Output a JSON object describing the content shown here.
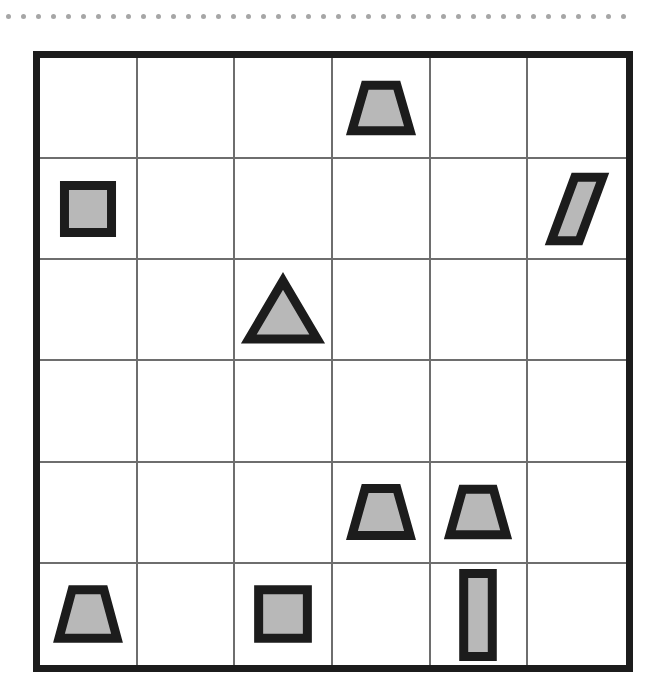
{
  "canvas": {
    "width": 662,
    "height": 691,
    "background": "#ffffff"
  },
  "decoration": {
    "dot_rule": {
      "name": "dotted-separator",
      "dot_count": 42,
      "dot_color": "#a6a6a6",
      "dot_diameter_px": 5,
      "spacing_px": 15
    }
  },
  "grid": {
    "rows": 6,
    "columns": 6,
    "border_color": "#1c1c1c",
    "border_width_px": 7,
    "line_color": "#6e6e6e",
    "line_width_px": 2,
    "cell_background": "#ffffff",
    "bounds_px": {
      "x": 33,
      "y": 51,
      "width": 600,
      "height": 621
    }
  },
  "style": {
    "shape_fill": "#b8b8b8",
    "shape_stroke": "#1c1c1c",
    "shape_stroke_width_px": 6
  },
  "shapes": [
    {
      "id": "shape-1",
      "type": "trapezoid",
      "row": 1,
      "col": 4,
      "label": "trapezoid",
      "width_px": 66,
      "height_px": 54
    },
    {
      "id": "shape-2",
      "type": "square",
      "row": 2,
      "col": 1,
      "label": "square",
      "width_px": 56,
      "height_px": 56
    },
    {
      "id": "shape-3",
      "type": "parallelogram",
      "row": 2,
      "col": 6,
      "label": "parallelogram",
      "width_px": 56,
      "height_px": 72
    },
    {
      "id": "shape-4",
      "type": "triangle",
      "row": 3,
      "col": 3,
      "label": "triangle",
      "width_px": 76,
      "height_px": 66
    },
    {
      "id": "shape-5",
      "type": "trapezoid",
      "row": 5,
      "col": 4,
      "label": "trapezoid",
      "width_px": 66,
      "height_px": 56
    },
    {
      "id": "shape-6",
      "type": "trapezoid",
      "row": 5,
      "col": 5,
      "label": "trapezoid",
      "width_px": 64,
      "height_px": 54
    },
    {
      "id": "shape-7",
      "type": "trapezoid",
      "row": 6,
      "col": 1,
      "label": "trapezoid",
      "width_px": 66,
      "height_px": 58
    },
    {
      "id": "shape-8",
      "type": "square",
      "row": 6,
      "col": 3,
      "label": "square",
      "width_px": 58,
      "height_px": 58
    },
    {
      "id": "shape-9",
      "type": "rectangle",
      "row": 6,
      "col": 5,
      "label": "tall-rectangle",
      "width_px": 34,
      "height_px": 90,
      "overflows_grid_bottom": true
    }
  ],
  "summary": {
    "total_shapes": 9,
    "counts": {
      "trapezoid": 4,
      "square": 2,
      "triangle": 1,
      "parallelogram": 1,
      "rectangle": 1
    },
    "empty_cells": 27
  }
}
